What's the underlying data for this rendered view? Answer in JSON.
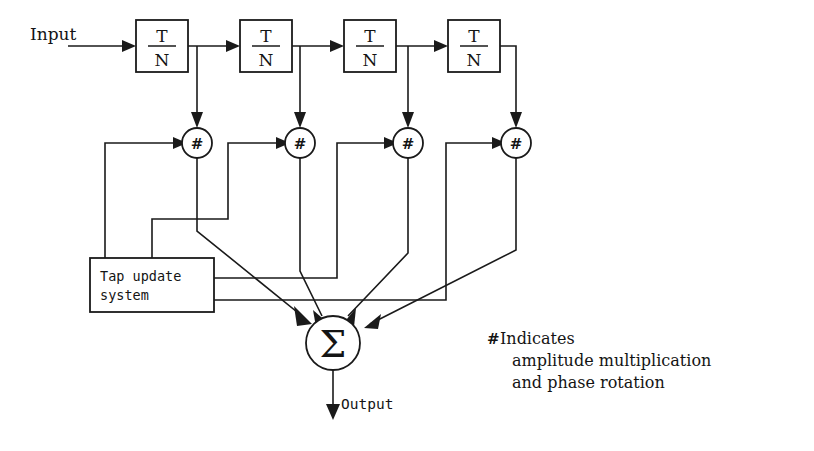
{
  "diagram": {
    "input_label": "Input",
    "output_label": "Output",
    "delay_elements": [
      {
        "numerator": "T",
        "denominator": "N"
      },
      {
        "numerator": "T",
        "denominator": "N"
      },
      {
        "numerator": "T",
        "denominator": "N"
      },
      {
        "numerator": "T",
        "denominator": "N"
      }
    ],
    "multipliers": [
      {
        "symbol": "#"
      },
      {
        "symbol": "#"
      },
      {
        "symbol": "#"
      },
      {
        "symbol": "#"
      }
    ],
    "summer": {
      "symbol": "Σ"
    },
    "tap_update_box": {
      "line1": "Tap update",
      "line2": "system"
    },
    "legend": {
      "symbol": "#",
      "line1": "Indicates",
      "line2": "amplitude multiplication",
      "line3": "and phase rotation"
    },
    "colors": {
      "ink": "#1a1a1a",
      "paper": "#ffffff"
    }
  }
}
